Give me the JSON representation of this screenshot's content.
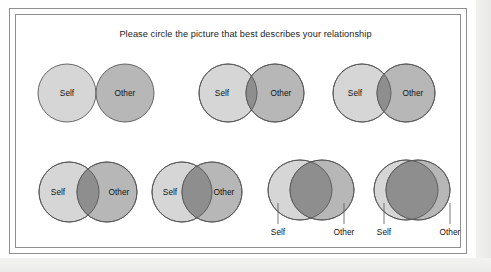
{
  "prompt": "Please circle the picture that best describes your relationship",
  "labels": {
    "self": "Self",
    "other": "Other"
  },
  "colors": {
    "self_fill": "#d6d6d6",
    "other_fill": "#b7b7b7",
    "overlap_fill": "#8e8e8e",
    "stroke": "#575757",
    "frame": "#8d8f93",
    "text": "#141414",
    "page": "#ffffff"
  },
  "scale": {
    "name": "Inclusion of Other in the Self",
    "steps": 7,
    "rows": 2
  },
  "items": [
    {
      "index": 1,
      "row": 1,
      "self_cx": 67,
      "self_cy": 93,
      "self_rx": 29,
      "self_ry": 29,
      "other_cx": 125,
      "other_cy": 93,
      "other_rx": 29,
      "other_ry": 29,
      "self_label_x": 67,
      "self_label_y": 94,
      "other_label_x": 125,
      "other_label_y": 94,
      "labels_inside": true,
      "overlap": 0
    },
    {
      "index": 2,
      "row": 1,
      "self_cx": 228,
      "self_cy": 93,
      "self_rx": 29,
      "self_ry": 29,
      "other_cx": 275,
      "other_cy": 93,
      "other_rx": 29,
      "other_ry": 29,
      "self_label_x": 222,
      "self_label_y": 94,
      "other_label_x": 281,
      "other_label_y": 94,
      "labels_inside": true,
      "overlap": 11
    },
    {
      "index": 3,
      "row": 1,
      "self_cx": 362,
      "self_cy": 93,
      "self_rx": 29,
      "self_ry": 29,
      "other_cx": 406,
      "other_cy": 93,
      "other_rx": 29,
      "other_ry": 29,
      "self_label_x": 355,
      "self_label_y": 94,
      "other_label_x": 413,
      "other_label_y": 94,
      "labels_inside": true,
      "overlap": 14
    },
    {
      "index": 4,
      "row": 1,
      "self_cx": 69,
      "self_cy": 192,
      "self_rx": 30,
      "self_ry": 30,
      "other_cx": 107,
      "other_cy": 192,
      "other_rx": 30,
      "other_ry": 30,
      "self_label_x": 58,
      "self_label_y": 193,
      "other_label_x": 119,
      "other_label_y": 193,
      "labels_inside": true,
      "overlap": 22
    },
    {
      "index": 5,
      "row": 2,
      "self_cx": 182,
      "self_cy": 192,
      "self_rx": 30,
      "self_ry": 30,
      "other_cx": 212,
      "other_cy": 192,
      "other_rx": 30,
      "other_ry": 30,
      "self_label_x": 170,
      "self_label_y": 193,
      "other_label_x": 224,
      "other_label_y": 193,
      "labels_inside": true,
      "overlap": 30
    },
    {
      "index": 6,
      "row": 2,
      "self_cx": 300,
      "self_cy": 190,
      "self_rx": 32,
      "self_ry": 30,
      "other_cx": 322,
      "other_cy": 190,
      "other_rx": 32,
      "other_ry": 30,
      "labels_inside": false,
      "self_tick_x": 278,
      "other_tick_x": 344,
      "tick_top": 203,
      "tick_bottom": 224,
      "self_label_x": 278,
      "self_label_y": 233,
      "other_label_x": 344,
      "other_label_y": 233,
      "overlap": 42
    },
    {
      "index": 7,
      "row": 2,
      "self_cx": 406,
      "self_cy": 190,
      "self_rx": 32,
      "self_ry": 30,
      "other_cx": 418,
      "other_cy": 190,
      "other_rx": 32,
      "other_ry": 30,
      "labels_inside": false,
      "self_tick_x": 384,
      "other_tick_x": 450,
      "tick_top": 203,
      "tick_bottom": 224,
      "self_label_x": 384,
      "self_label_y": 233,
      "other_label_x": 450,
      "other_label_y": 233,
      "overlap": 52
    }
  ]
}
